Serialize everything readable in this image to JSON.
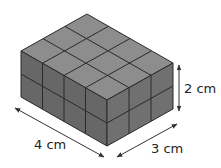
{
  "figure": {
    "dimensions": {
      "length": {
        "label": "4 cm",
        "units": 4
      },
      "width": {
        "label": "3 cm",
        "units": 3
      },
      "height": {
        "label": "2 cm",
        "units": 2
      }
    },
    "colors": {
      "top_face": "#8d8d8d",
      "front_face": "#676767",
      "side_face": "#707070",
      "grid_lines": "#2a2a2a",
      "arrows": "#333333"
    }
  }
}
